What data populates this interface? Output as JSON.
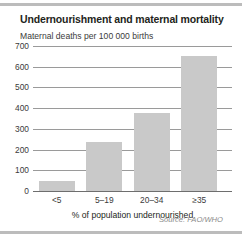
{
  "figure": {
    "title": "Undernourishment and maternal mortality",
    "source": "Source: FAO/WHO"
  },
  "chart_data": {
    "type": "bar",
    "title": "Undernourishment and maternal mortality",
    "subtitle": "Maternal deaths per 100 000 births",
    "categories": [
      "<5",
      "5–19",
      "20–34",
      "≥35"
    ],
    "values": [
      50,
      235,
      375,
      650
    ],
    "xlabel": "% of population undernourished",
    "ylabel": "Maternal deaths per 100 000 births",
    "ylim": [
      0,
      700
    ],
    "yticks": [
      0,
      100,
      200,
      300,
      400,
      500,
      600,
      700
    ],
    "ytick_labels": [
      "0",
      "100",
      "200",
      "300",
      "400",
      "500",
      "600",
      "700"
    ],
    "grid": true,
    "legend": false,
    "bar_color": "#c9c9c9",
    "grid_color": "#9a9a9a",
    "source": "Source: FAO/WHO"
  }
}
